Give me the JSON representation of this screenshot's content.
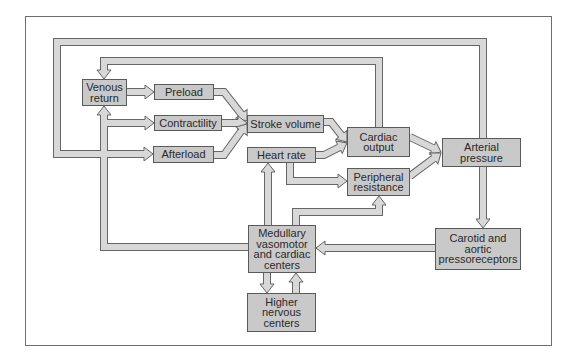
{
  "diagram": {
    "type": "flow-diagram",
    "topic": "Regulation of arterial pressure",
    "nodes": {
      "venous_return": "Venous\nreturn",
      "preload": "Preload",
      "contractility": "Contractility",
      "afterload": "Afterload",
      "stroke_volume": "Stroke volume",
      "heart_rate": "Heart rate",
      "cardiac_output": "Cardiac\noutput",
      "peripheral_resistance": "Peripheral\nresistance",
      "arterial_pressure": "Arterial\npressure",
      "medullary_centers": "Medullary\nvasomotor\nand cardiac\ncenters",
      "higher_nervous_centers": "Higher\nnervous\ncenters",
      "pressoreceptors": "Carotid and\naortic\npressoreceptors"
    },
    "edges": [
      {
        "from": "Venous return",
        "to": "Preload"
      },
      {
        "from": "Preload",
        "to": "Stroke volume"
      },
      {
        "from": "Contractility",
        "to": "Stroke volume"
      },
      {
        "from": "Afterload",
        "to": "Stroke volume"
      },
      {
        "from": "Stroke volume",
        "to": "Cardiac output"
      },
      {
        "from": "Heart rate",
        "to": "Cardiac output"
      },
      {
        "from": "Heart rate",
        "to": "Peripheral resistance"
      },
      {
        "from": "Cardiac output",
        "to": "Arterial pressure"
      },
      {
        "from": "Peripheral resistance",
        "to": "Arterial pressure"
      },
      {
        "from": "Cardiac output",
        "to": "Venous return"
      },
      {
        "from": "Arterial pressure",
        "to": "Afterload"
      },
      {
        "from": "Arterial pressure",
        "to": "Carotid and aortic pressoreceptors"
      },
      {
        "from": "Carotid and aortic pressoreceptors",
        "to": "Medullary vasomotor and cardiac centers"
      },
      {
        "from": "Medullary vasomotor and cardiac centers",
        "to": "Venous return"
      },
      {
        "from": "Medullary vasomotor and cardiac centers",
        "to": "Contractility"
      },
      {
        "from": "Medullary vasomotor and cardiac centers",
        "to": "Heart rate"
      },
      {
        "from": "Medullary vasomotor and cardiac centers",
        "to": "Peripheral resistance"
      },
      {
        "from": "Medullary vasomotor and cardiac centers",
        "to": "Higher nervous centers"
      },
      {
        "from": "Higher nervous centers",
        "to": "Medullary vasomotor and cardiac centers"
      }
    ],
    "colors": {
      "box_fill": "#c9c9c9",
      "arrow_fill": "#d8d8d8",
      "outline": "#666666",
      "frame": "#6e6e6e"
    }
  }
}
